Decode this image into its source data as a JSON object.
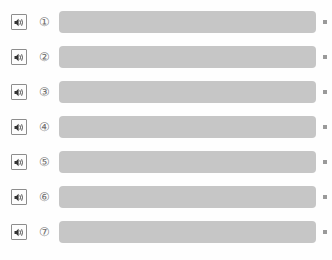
{
  "screen": {
    "name": "audio-question-list",
    "background_color": "#fefefe",
    "bar_color": "#c6c6c6",
    "marker_color": "#9a9a9a",
    "icon_border_color": "#8d8d8d",
    "index_text_color": "#6f6f6f"
  },
  "rows": [
    {
      "index_label": "①",
      "icon": "speaker-icon",
      "bar_label": "",
      "marker": "▪"
    },
    {
      "index_label": "②",
      "icon": "speaker-icon",
      "bar_label": "",
      "marker": "▪"
    },
    {
      "index_label": "③",
      "icon": "speaker-icon",
      "bar_label": "",
      "marker": "▪"
    },
    {
      "index_label": "④",
      "icon": "speaker-icon",
      "bar_label": "",
      "marker": "▪"
    },
    {
      "index_label": "⑤",
      "icon": "speaker-icon",
      "bar_label": "",
      "marker": "▪"
    },
    {
      "index_label": "⑥",
      "icon": "speaker-icon",
      "bar_label": "",
      "marker": "▪"
    },
    {
      "index_label": "⑦",
      "icon": "speaker-icon",
      "bar_label": "",
      "marker": "▪"
    }
  ]
}
